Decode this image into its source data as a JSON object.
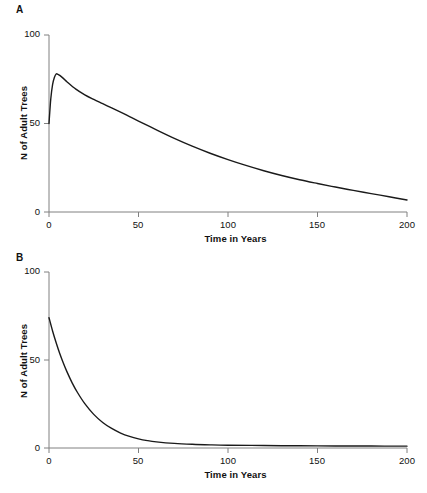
{
  "figure": {
    "background_color": "#ffffff",
    "line_color": "#1a1a1a",
    "axis_color": "#808080",
    "text_color": "#111111"
  },
  "panels": [
    {
      "label": "A",
      "xlabel": "Time in Years",
      "ylabel": "N of Adult Trees",
      "x_ticks": [
        "0",
        "50",
        "100",
        "150",
        "200"
      ],
      "y_ticks": [
        "0",
        "50",
        "100"
      ]
    },
    {
      "label": "B",
      "xlabel": "Time in Years",
      "ylabel": "N of Adult Trees",
      "x_ticks": [
        "0",
        "50",
        "100",
        "150",
        "200"
      ],
      "y_ticks": [
        "0",
        "50",
        "100"
      ]
    }
  ],
  "chart_data": [
    {
      "type": "line",
      "title": "A",
      "xlabel": "Time in Years",
      "ylabel": "N of Adult Trees",
      "xlim": [
        0,
        200
      ],
      "ylim": [
        0,
        100
      ],
      "xticks": [
        0,
        50,
        100,
        150,
        200
      ],
      "yticks": [
        0,
        50,
        100
      ],
      "grid": false,
      "legend": "none",
      "description": "Sharp initial rise from 50 to a peak of about 78 near year 4, followed by a slow monotonic decay to about 3 at year 200.",
      "x": [
        0,
        1,
        2,
        3,
        4,
        5,
        6,
        8,
        10,
        15,
        20,
        25,
        30,
        35,
        40,
        45,
        50,
        60,
        70,
        80,
        90,
        100,
        110,
        120,
        130,
        140,
        150,
        160,
        170,
        180,
        190,
        200
      ],
      "y": [
        50,
        64,
        72,
        76,
        78,
        77.8,
        77.2,
        75.5,
        73.6,
        69.4,
        66.2,
        63.6,
        61.2,
        58.8,
        56.4,
        53.9,
        51.4,
        46.4,
        41.6,
        37.2,
        33.2,
        29.6,
        26.3,
        23.3,
        20.6,
        18.2,
        16.1,
        14.1,
        12.2,
        10.4,
        8.6,
        6.8
      ]
    },
    {
      "type": "line",
      "title": "B",
      "xlabel": "Time in Years",
      "ylabel": "N of Adult Trees",
      "xlim": [
        0,
        200
      ],
      "ylim": [
        0,
        100
      ],
      "xticks": [
        0,
        50,
        100,
        150,
        200
      ],
      "yticks": [
        0,
        50,
        100
      ],
      "grid": false,
      "legend": "none",
      "description": "Monotonic exponential decay from about 74 at year 0 to near zero by year 70, then a long flat tail close to 1 out to year 200.",
      "x": [
        0,
        2,
        4,
        6,
        8,
        10,
        13,
        16,
        20,
        25,
        30,
        35,
        40,
        45,
        50,
        55,
        60,
        70,
        80,
        90,
        100,
        120,
        140,
        160,
        180,
        200
      ],
      "y": [
        74,
        66.5,
        59.8,
        53.7,
        48.3,
        43.4,
        36.9,
        31.4,
        25.2,
        19.1,
        14.5,
        11.1,
        8.5,
        6.6,
        5.2,
        4.2,
        3.5,
        2.6,
        2.1,
        1.8,
        1.6,
        1.4,
        1.25,
        1.15,
        1.1,
        1.05
      ]
    }
  ]
}
